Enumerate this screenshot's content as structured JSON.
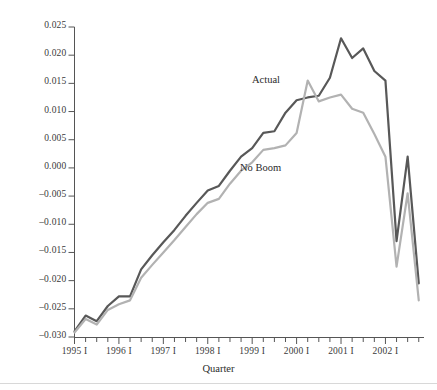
{
  "chart_data": {
    "type": "line",
    "title": "",
    "xlabel": "Quarter",
    "ylabel": "",
    "ylim": [
      -0.03,
      0.025
    ],
    "ytick_step": 0.005,
    "yticks": [
      0.025,
      0.02,
      0.015,
      0.01,
      0.005,
      0.0,
      -0.005,
      -0.01,
      -0.015,
      -0.02,
      -0.025,
      -0.03
    ],
    "ytick_labels": [
      "0.025",
      "0.020",
      "0.015",
      "0.010",
      "0.005",
      "0.000",
      "-0.005",
      "-0.010",
      "-0.015",
      "-0.020",
      "-0.025",
      "-0.030"
    ],
    "xtick_labels": [
      "1995 I",
      "1996 I",
      "1997 I",
      "1998 I",
      "1999 I",
      "2000 I",
      "2001 I",
      "2002 I"
    ],
    "x_minor_ticks_per_label": 4,
    "grid": false,
    "legend_position": "inline-annotations",
    "x": [
      "1995 I",
      "1995 II",
      "1995 III",
      "1995 IV",
      "1996 I",
      "1996 II",
      "1996 III",
      "1996 IV",
      "1997 I",
      "1997 II",
      "1997 III",
      "1997 IV",
      "1998 I",
      "1998 II",
      "1998 III",
      "1998 IV",
      "1999 I",
      "1999 II",
      "1999 III",
      "1999 IV",
      "2000 I",
      "2000 II",
      "2000 III",
      "2000 IV",
      "2001 I",
      "2001 II",
      "2001 III",
      "2001 IV",
      "2002 I",
      "2002 II",
      "2002 III",
      "2002 IV"
    ],
    "series": [
      {
        "name": "Actual",
        "color": "#585858",
        "values": [
          -0.029,
          -0.0262,
          -0.0272,
          -0.0245,
          -0.0228,
          -0.0228,
          -0.018,
          -0.0155,
          -0.0132,
          -0.011,
          -0.0085,
          -0.0062,
          -0.004,
          -0.0032,
          -0.0005,
          0.002,
          0.0035,
          0.0062,
          0.0065,
          0.0098,
          0.012,
          0.0125,
          0.0128,
          0.016,
          0.023,
          0.0195,
          0.0212,
          0.0172,
          0.0155,
          -0.013,
          0.002,
          -0.0205
        ]
      },
      {
        "name": "No Boom",
        "color": "#b2b2b2",
        "values": [
          -0.0292,
          -0.0268,
          -0.0278,
          -0.0252,
          -0.0242,
          -0.0235,
          -0.0195,
          -0.0172,
          -0.015,
          -0.0128,
          -0.0105,
          -0.0082,
          -0.0062,
          -0.0055,
          -0.0028,
          -0.0005,
          0.001,
          0.0032,
          0.0035,
          0.004,
          0.0062,
          0.0155,
          0.0118,
          0.0125,
          0.013,
          0.0105,
          0.0098,
          0.006,
          0.002,
          -0.0175,
          -0.0045,
          -0.0235
        ]
      }
    ],
    "annotations": [
      {
        "text": "Actual",
        "series": "Actual"
      },
      {
        "text": "No Boom",
        "series": "No Boom"
      }
    ]
  },
  "axis": {
    "x_title": "Quarter"
  }
}
